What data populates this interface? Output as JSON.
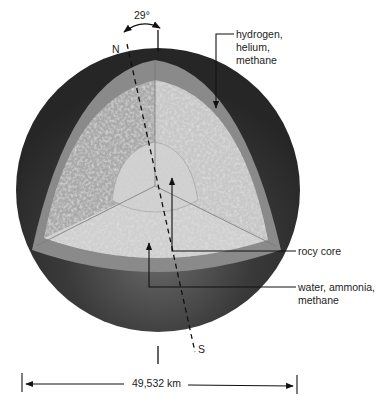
{
  "figure": {
    "tilt_label": "29°",
    "north_label": "N",
    "south_label": "S",
    "diameter_label": "49,532 km"
  },
  "layers": [
    {
      "name": "atmosphere",
      "label_lines": [
        "hydrogen,",
        "helium,",
        "methane"
      ],
      "color": "#3a3a3a"
    },
    {
      "name": "outer-band",
      "color": "#8c8c8c"
    },
    {
      "name": "mantle",
      "label_lines": [
        "water, ammonia,",
        "methane"
      ],
      "color": "#bdbdbd"
    },
    {
      "name": "core",
      "label_lines": [
        "rocy core"
      ],
      "color": "#cfcfcf"
    }
  ],
  "labels": {
    "atmosphere": "hydrogen, helium, methane",
    "atmosphere_l1": "hydrogen,",
    "atmosphere_l2": "helium,",
    "atmosphere_l3": "methane",
    "core": "rocy core",
    "mantle_l1": "water, ammonia,",
    "mantle_l2": "methane"
  },
  "colors": {
    "sphere_dark": "#2e2e2e",
    "band": "#8a8a8a",
    "mantle_light": "#c4c4c4",
    "mantle_dark": "#a8a8a8",
    "core": "#d6d6d6",
    "line": "#111111"
  }
}
